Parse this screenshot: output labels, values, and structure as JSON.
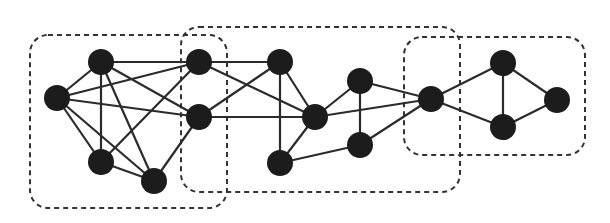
{
  "diagram": {
    "type": "graph",
    "colors": {
      "node": "#1c1c1c",
      "edge": "#2b2b2b",
      "group_border": "#333333",
      "background": "#ffffff"
    },
    "node_radius": 13,
    "nodes": [
      {
        "id": "A",
        "x": 57,
        "y": 98
      },
      {
        "id": "B",
        "x": 101,
        "y": 62
      },
      {
        "id": "C",
        "x": 101,
        "y": 162
      },
      {
        "id": "D",
        "x": 154,
        "y": 181
      },
      {
        "id": "E",
        "x": 199,
        "y": 62
      },
      {
        "id": "F",
        "x": 199,
        "y": 117
      },
      {
        "id": "G",
        "x": 280,
        "y": 62
      },
      {
        "id": "H",
        "x": 315,
        "y": 117
      },
      {
        "id": "I",
        "x": 280,
        "y": 163
      },
      {
        "id": "J",
        "x": 360,
        "y": 81
      },
      {
        "id": "K",
        "x": 360,
        "y": 145
      },
      {
        "id": "L",
        "x": 431,
        "y": 99
      },
      {
        "id": "M",
        "x": 503,
        "y": 63
      },
      {
        "id": "N",
        "x": 503,
        "y": 127
      },
      {
        "id": "O",
        "x": 557,
        "y": 100
      }
    ],
    "edges": [
      [
        "A",
        "B"
      ],
      [
        "A",
        "E"
      ],
      [
        "A",
        "F"
      ],
      [
        "A",
        "C"
      ],
      [
        "A",
        "D"
      ],
      [
        "B",
        "E"
      ],
      [
        "B",
        "C"
      ],
      [
        "B",
        "D"
      ],
      [
        "B",
        "F"
      ],
      [
        "C",
        "D"
      ],
      [
        "C",
        "E"
      ],
      [
        "D",
        "F"
      ],
      [
        "E",
        "G"
      ],
      [
        "E",
        "H"
      ],
      [
        "F",
        "G"
      ],
      [
        "F",
        "H"
      ],
      [
        "G",
        "H"
      ],
      [
        "G",
        "I"
      ],
      [
        "H",
        "I"
      ],
      [
        "H",
        "J"
      ],
      [
        "H",
        "L"
      ],
      [
        "I",
        "K"
      ],
      [
        "J",
        "K"
      ],
      [
        "J",
        "L"
      ],
      [
        "K",
        "L"
      ],
      [
        "L",
        "M"
      ],
      [
        "L",
        "N"
      ],
      [
        "M",
        "N"
      ],
      [
        "M",
        "O"
      ],
      [
        "N",
        "O"
      ]
    ],
    "groups": [
      {
        "id": "group-1",
        "x": 30,
        "y": 35,
        "w": 197,
        "h": 173,
        "r": 18
      },
      {
        "id": "group-2",
        "x": 181,
        "y": 27,
        "w": 279,
        "h": 165,
        "r": 18
      },
      {
        "id": "group-3",
        "x": 404,
        "y": 37,
        "w": 181,
        "h": 118,
        "r": 18
      }
    ]
  }
}
